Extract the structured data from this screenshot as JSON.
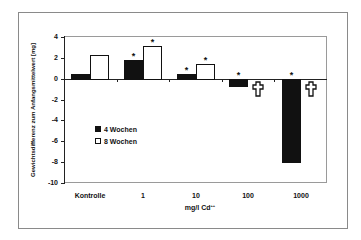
{
  "chart_data": {
    "type": "bar",
    "title": "",
    "xlabel": "mg/l Cd",
    "xlabel_superscript": "++",
    "ylabel": "Gewichtsdifferenz zum Anfangsmittelwert [mg]",
    "ylim": [
      -10,
      4
    ],
    "yticks": [
      4,
      2,
      0,
      -2,
      -4,
      -6,
      -8,
      -10
    ],
    "categories": [
      "Kontrolle",
      "1",
      "10",
      "100",
      "1000"
    ],
    "series": [
      {
        "name": "4 Wochen",
        "color": "#111111",
        "values": [
          0.45,
          1.8,
          0.5,
          -0.75,
          -8.1
        ],
        "significant": [
          false,
          true,
          true,
          true,
          true
        ]
      },
      {
        "name": "8 Wochen",
        "color": "#ffffff",
        "values": [
          2.3,
          3.1,
          1.4,
          null,
          null
        ],
        "significant": [
          false,
          true,
          true,
          false,
          false
        ]
      }
    ],
    "annotations": [
      {
        "category": "100",
        "series": "8 Wochen",
        "symbol": "cross",
        "meaning": "dead"
      },
      {
        "category": "1000",
        "series": "8 Wochen",
        "symbol": "cross",
        "meaning": "dead"
      }
    ],
    "grid": false,
    "legend_position": "inside-left-middle",
    "significance_marker": "*"
  },
  "legend": {
    "items": [
      {
        "label": "4 Wochen"
      },
      {
        "label": "8 Wochen"
      }
    ]
  }
}
